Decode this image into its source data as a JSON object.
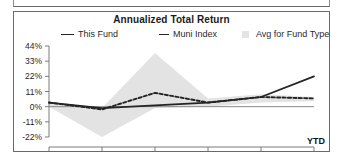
{
  "chart_panel": {
    "title": "Annualized Total Return",
    "ytd_label": "YTD"
  },
  "legend": {
    "items": [
      {
        "label": "This Fund",
        "marker": "solid-line",
        "color": "#242424"
      },
      {
        "label": "Muni Index",
        "marker": "dashed-line",
        "color": "#242424"
      },
      {
        "label": "Avg for Fund Type",
        "marker": "shaded-box",
        "color": "#e3e3e3"
      }
    ]
  },
  "chart_data": {
    "type": "line",
    "title": "Annualized Total Return",
    "xlabel": "",
    "ylabel": "",
    "grid": false,
    "legend_position": "top",
    "x": [
      "2007",
      "2008",
      "2009",
      "2010",
      "2011",
      "2012"
    ],
    "xtick_labels": [
      "2007",
      "2008",
      "2009",
      "2010",
      "2011",
      "2012"
    ],
    "xlim": [
      "2007",
      "2012"
    ],
    "ylim": [
      -22,
      44
    ],
    "ytick_labels": [
      "44%",
      "33%",
      "22%",
      "11%",
      "0%",
      "-11%",
      "-22%"
    ],
    "ytick_values": [
      44,
      33,
      22,
      11,
      0,
      -11,
      -22
    ],
    "series": [
      {
        "name": "This Fund",
        "style": "solid",
        "color": "#242424",
        "values": [
          3,
          -1,
          1,
          3,
          7,
          22
        ]
      },
      {
        "name": "Muni Index",
        "style": "dashed",
        "color": "#242424",
        "values": [
          3,
          -2,
          10,
          3,
          7,
          6
        ]
      },
      {
        "name": "Avg for Fund Type",
        "style": "band",
        "color": "#e3e3e3",
        "upper": [
          3,
          -1,
          39,
          6,
          9,
          7
        ],
        "lower": [
          0,
          -22,
          -1,
          0,
          3,
          4
        ]
      }
    ]
  }
}
